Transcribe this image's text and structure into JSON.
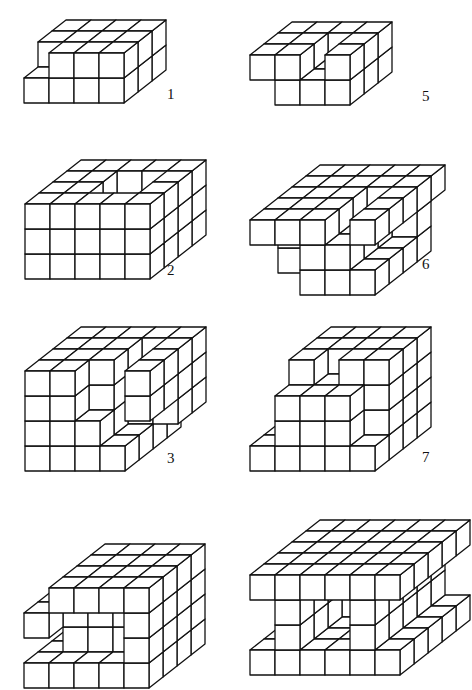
{
  "figures": [
    {
      "id": 1,
      "label": "1",
      "x": 22,
      "y": 18,
      "labelX": 167,
      "labelY": 86
    },
    {
      "id": 5,
      "label": "5",
      "x": 248,
      "y": 20,
      "labelX": 422,
      "labelY": 88
    },
    {
      "id": 2,
      "label": "2",
      "x": 23,
      "y": 158,
      "labelX": 167,
      "labelY": 262
    },
    {
      "id": 6,
      "label": "6",
      "x": 248,
      "y": 163,
      "labelX": 422,
      "labelY": 256
    },
    {
      "id": 3,
      "label": "3",
      "x": 23,
      "y": 325,
      "labelX": 167,
      "labelY": 450
    },
    {
      "id": 7,
      "label": "7",
      "x": 248,
      "y": 325,
      "labelX": 422,
      "labelY": 449
    },
    {
      "id": 4,
      "label": "",
      "x": 22,
      "y": 542
    },
    {
      "id": 8,
      "label": "",
      "x": 248,
      "y": 518
    }
  ],
  "style": {
    "stroke": "#111111",
    "fill": "#ffffff",
    "cube": 25,
    "dx": 14,
    "dy": 11
  }
}
